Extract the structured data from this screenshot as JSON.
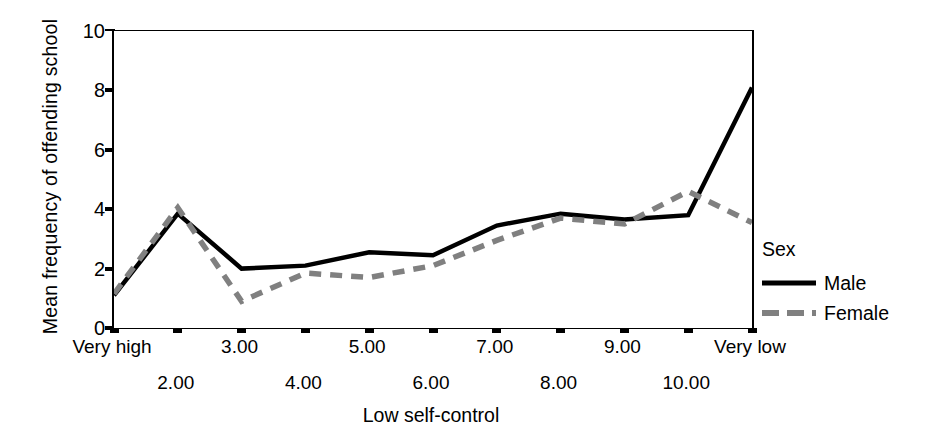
{
  "chart_data": {
    "type": "line",
    "title": "",
    "xlabel": "Low self-control",
    "ylabel": "Mean frequency of offending school",
    "categories": [
      "Very high",
      "2.00",
      "3.00",
      "4.00",
      "5.00",
      "6.00",
      "7.00",
      "8.00",
      "9.00",
      "10.00",
      "Very low"
    ],
    "xtick_rows": [
      0,
      1,
      0,
      1,
      0,
      1,
      0,
      1,
      0,
      1,
      0
    ],
    "ylim": [
      0,
      10
    ],
    "yticks": [
      0,
      2,
      4,
      6,
      8,
      10
    ],
    "ytick_labels": [
      "0",
      "2",
      "4",
      "6",
      "8",
      "10"
    ],
    "grid": false,
    "legend_position": "right",
    "legend_title": "Sex",
    "series": [
      {
        "name": "Male",
        "style": "solid",
        "color": "#000000",
        "values": [
          1.1,
          3.85,
          2.0,
          2.1,
          2.55,
          2.45,
          3.45,
          3.85,
          3.65,
          3.8,
          8.1
        ]
      },
      {
        "name": "Female",
        "style": "dashed",
        "color": "#808080",
        "values": [
          1.15,
          4.05,
          0.9,
          1.85,
          1.7,
          2.1,
          2.95,
          3.7,
          3.5,
          4.6,
          3.55
        ]
      }
    ]
  },
  "legend": {
    "title": "Sex",
    "entries": [
      {
        "label": "Male",
        "style": "solid",
        "color": "#000000"
      },
      {
        "label": "Female",
        "style": "dashed",
        "color": "#808080"
      }
    ]
  }
}
